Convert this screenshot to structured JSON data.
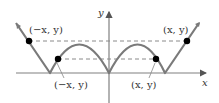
{
  "diagram": {
    "axes": {
      "x_label": "x",
      "y_label": "y"
    },
    "point_labels": {
      "upper_left": "(−x, y)",
      "upper_right": "(x, y)",
      "lower_left": "(−x, y)",
      "lower_right": "(x, y)"
    },
    "colors": {
      "curve": "#7a7a7a",
      "axis": "#808080",
      "dashed": "#8a8a8a",
      "point": "#000000",
      "text": "#333333"
    }
  }
}
